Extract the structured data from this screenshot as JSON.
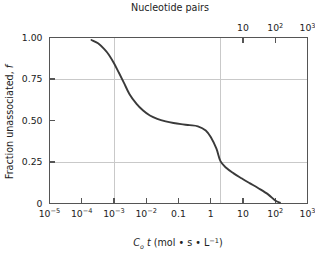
{
  "figure": {
    "top_axis_title": "Nucleotide pairs",
    "bottom_axis_title_parts": {
      "c": "C",
      "c_sub": "o",
      "t": "t",
      "rest": " (mol • s • L",
      "exp": "−1",
      "close": ")"
    },
    "y_axis_title_parts": {
      "main": "Fraction unassociated, ",
      "symbol": "f"
    }
  },
  "chart_data": {
    "type": "line",
    "title": "Nucleotide pairs",
    "xlabel": "C₀t (mol • s • L⁻¹)",
    "ylabel": "Fraction unassociated, f",
    "xscale": "log",
    "xlim": [
      1e-05,
      1000.0
    ],
    "ylim": [
      0,
      1.0
    ],
    "grid": true,
    "legend": "none",
    "x_tick_labels": [
      "10⁻⁵",
      "10⁻⁴",
      "10⁻³",
      "10⁻²",
      "0.1",
      "1",
      "10",
      "10²",
      "10³"
    ],
    "x_tick_values": [
      1e-05,
      0.0001,
      0.001,
      0.01,
      0.1,
      1,
      10,
      100,
      1000
    ],
    "y_tick_labels": [
      "0",
      "0.25",
      "0.50",
      "0.75",
      "1.00"
    ],
    "y_tick_values": [
      0,
      0.25,
      0.5,
      0.75,
      1.0
    ],
    "top_axis": {
      "label": "Nucleotide pairs",
      "tick_labels": [
        "10",
        "10²",
        "10³",
        "10⁴",
        "10⁵",
        "10⁶",
        "10⁷",
        "10⁸"
      ],
      "tick_values": [
        10,
        100,
        1000,
        10000,
        100000,
        1000000,
        10000000,
        100000000
      ]
    },
    "gridlines": {
      "vertical_at_x": [
        0.001,
        2.0
      ],
      "horizontal_at_y": [
        0.75,
        0.25
      ]
    },
    "series": [
      {
        "name": "fraction unassociated",
        "x": [
          0.0002,
          0.00032,
          0.0005,
          0.0007,
          0.001,
          0.0014,
          0.002,
          0.003,
          0.005,
          0.008,
          0.013,
          0.022,
          0.04,
          0.07,
          0.12,
          0.22,
          0.4,
          0.7,
          1.0,
          1.5,
          2.0,
          3.0,
          5.0,
          9.0,
          16.0,
          30.0,
          60.0,
          100.0,
          140.0
        ],
        "y": [
          0.985,
          0.965,
          0.93,
          0.895,
          0.845,
          0.79,
          0.73,
          0.66,
          0.6,
          0.56,
          0.53,
          0.51,
          0.495,
          0.485,
          0.478,
          0.472,
          0.465,
          0.44,
          0.4,
          0.33,
          0.255,
          0.215,
          0.183,
          0.152,
          0.123,
          0.092,
          0.055,
          0.018,
          0.005
        ]
      }
    ]
  },
  "x_ticks": [
    {
      "label_base": "10",
      "exp": "−5",
      "x": 1e-05
    },
    {
      "label_base": "10",
      "exp": "−4",
      "x": 0.0001
    },
    {
      "label_base": "10",
      "exp": "−3",
      "x": 0.001
    },
    {
      "label_base": "10",
      "exp": "−2",
      "x": 0.01
    },
    {
      "label_base": "0.1",
      "exp": "",
      "x": 0.1
    },
    {
      "label_base": "1",
      "exp": "",
      "x": 1
    },
    {
      "label_base": "10",
      "exp": "",
      "x": 10
    },
    {
      "label_base": "10",
      "exp": "2",
      "x": 100
    },
    {
      "label_base": "10",
      "exp": "3",
      "x": 1000
    }
  ],
  "top_ticks": [
    {
      "label_base": "10",
      "exp": "",
      "x": 10
    },
    {
      "label_base": "10",
      "exp": "2",
      "x": 100
    },
    {
      "label_base": "10",
      "exp": "3",
      "x": 1000
    },
    {
      "label_base": "10",
      "exp": "4",
      "x": 10000
    },
    {
      "label_base": "10",
      "exp": "5",
      "x": 100000
    },
    {
      "label_base": "10",
      "exp": "6",
      "x": 1000000
    },
    {
      "label_base": "10",
      "exp": "7",
      "x": 10000000
    },
    {
      "label_base": "10",
      "exp": "8",
      "x": 100000000
    }
  ],
  "y_ticks": [
    {
      "label": "1.00",
      "y": 1.0
    },
    {
      "label": "0.75",
      "y": 0.75
    },
    {
      "label": "0.50",
      "y": 0.5
    },
    {
      "label": "0.25",
      "y": 0.25
    },
    {
      "label": "0",
      "y": 0
    }
  ],
  "colors": {
    "curve": "#3a3a3a",
    "frame": "#555555",
    "grid": "#c9c9c9",
    "text": "#1a1a1a"
  }
}
